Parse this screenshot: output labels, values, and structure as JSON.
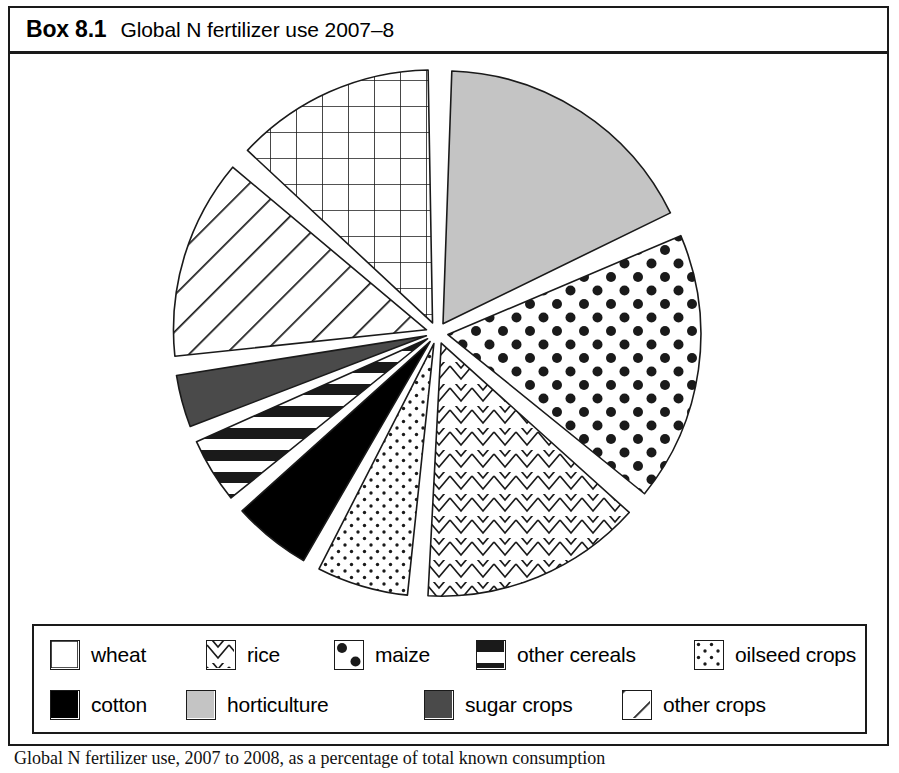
{
  "header": {
    "box_number": "Box 8.1",
    "title": "Global N fertilizer use 2007–8"
  },
  "caption": {
    "text": "Global N fertilizer use, 2007 to 2008, as a percentage of total known consumption"
  },
  "colors": {
    "ink": "#1a1a1a",
    "paper": "#ffffff",
    "horticulture_gray": "#c4c4c4",
    "sugar_gray": "#4a4a4a",
    "cotton_black": "#000000"
  },
  "legend": {
    "rows": [
      [
        {
          "key": "wheat",
          "label": "wheat",
          "pattern": "grid",
          "offset": 16,
          "swatch": 30
        },
        {
          "key": "rice",
          "label": "rice",
          "pattern": "zigzag",
          "offset": 172,
          "swatch": 30
        },
        {
          "key": "maize",
          "label": "maize",
          "pattern": "dots",
          "offset": 300,
          "swatch": 30
        },
        {
          "key": "other_cereals",
          "label": "other cereals",
          "pattern": "stripes",
          "offset": 442,
          "swatch": 30
        },
        {
          "key": "oilseed_crops",
          "label": "oilseed crops",
          "pattern": "finedots",
          "offset": 660,
          "swatch": 30
        }
      ],
      [
        {
          "key": "cotton",
          "label": "cotton",
          "pattern": "solidblack",
          "offset": 16,
          "swatch": 30
        },
        {
          "key": "horticulture",
          "label": "horticulture",
          "pattern": "lightgray",
          "offset": 152,
          "swatch": 30
        },
        {
          "key": "sugar_crops",
          "label": "sugar crops",
          "pattern": "darkgray",
          "offset": 390,
          "swatch": 30
        },
        {
          "key": "other_crops",
          "label": "other crops",
          "pattern": "diagonal",
          "offset": 588,
          "swatch": 30
        }
      ]
    ]
  },
  "chart_data": {
    "type": "pie",
    "title": "Global N fertilizer use 2007–8",
    "unit": "percent of total",
    "legend_position": "bottom",
    "exploded": true,
    "start_angle_deg": 0,
    "center": {
      "x": 427,
      "y": 279
    },
    "radius": 253,
    "labels": [
      "horticulture",
      "maize",
      "rice",
      "oilseed crops",
      "cotton",
      "other cereals",
      "sugar crops",
      "other crops",
      "wheat"
    ],
    "values": [
      18,
      18,
      15,
      6,
      4,
      4,
      4,
      13,
      18
    ],
    "slices": [
      {
        "label": "horticulture",
        "value": 18,
        "start_deg": 2,
        "end_deg": 64,
        "pattern": "lightgray"
      },
      {
        "label": "maize",
        "value": 18,
        "start_deg": 67,
        "end_deg": 129,
        "pattern": "dots"
      },
      {
        "label": "rice",
        "value": 15,
        "start_deg": 132,
        "end_deg": 183,
        "pattern": "zigzag"
      },
      {
        "label": "oilseed crops",
        "value": 6,
        "start_deg": 186,
        "end_deg": 207,
        "pattern": "finedots"
      },
      {
        "label": "cotton",
        "value": 4,
        "start_deg": 210,
        "end_deg": 228,
        "pattern": "solidblack"
      },
      {
        "label": "other cereals",
        "value": 4,
        "start_deg": 231,
        "end_deg": 246,
        "pattern": "stripes"
      },
      {
        "label": "sugar crops",
        "value": 4,
        "start_deg": 249,
        "end_deg": 261,
        "pattern": "darkgray"
      },
      {
        "label": "other crops",
        "value": 13,
        "start_deg": 264,
        "end_deg": 310,
        "pattern": "diagonal"
      },
      {
        "label": "wheat",
        "value": 18,
        "start_deg": 313,
        "end_deg": 359,
        "pattern": "grid"
      }
    ]
  }
}
